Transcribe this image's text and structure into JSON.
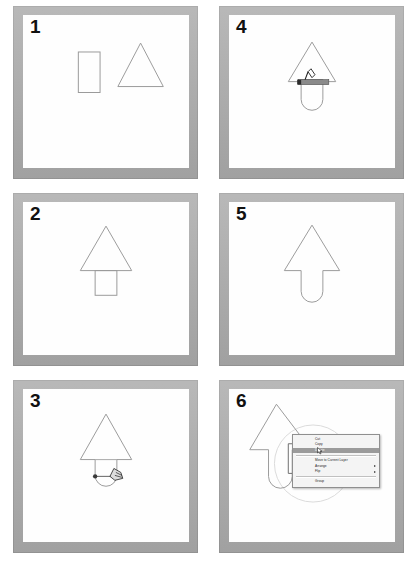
{
  "figure": {
    "panel_count": 6,
    "columns": 2,
    "rows": 3,
    "frame_color": "#a9a9a9",
    "canvas_color": "#fefefe",
    "shape_stroke_color": "#9a9a9a",
    "number_color": "#111111"
  },
  "panels": [
    {
      "number": "1",
      "caption": "Rectangle and triangle drawn separately",
      "shapes": [
        "rectangle",
        "triangle"
      ]
    },
    {
      "number": "2",
      "caption": "Rectangle positioned below triangle",
      "shapes": [
        "rectangle",
        "triangle"
      ]
    },
    {
      "number": "3",
      "caption": "Dragging corner handle to round rectangle bottom",
      "shapes": [
        "rounded-rectangle",
        "triangle"
      ],
      "cursor": "hand-drag-cursor",
      "handle": "corner-radius-handle"
    },
    {
      "number": "4",
      "caption": "Selecting both shapes with selection bar",
      "shapes": [
        "rounded-rectangle",
        "triangle"
      ],
      "cursor": "pointer-cursor",
      "selection": "selection-bar"
    },
    {
      "number": "5",
      "caption": "Merged arrow shape with rounded tail",
      "shapes": [
        "arrow"
      ]
    },
    {
      "number": "6",
      "caption": "Context menu opened on arrow shape",
      "shapes": [
        "arrow"
      ],
      "selection": "selection-circle",
      "cursor": "pointer-cursor"
    }
  ],
  "context_menu": {
    "items": [
      {
        "label": "Cut",
        "highlighted": false,
        "submenu": false
      },
      {
        "label": "Copy",
        "highlighted": false,
        "submenu": false
      },
      {
        "label": "Delete",
        "highlighted": true,
        "submenu": false
      },
      {
        "label": "Move to Current Layer",
        "highlighted": false,
        "submenu": false
      },
      {
        "label": "Arrange",
        "highlighted": false,
        "submenu": true
      },
      {
        "label": "Flip",
        "highlighted": false,
        "submenu": true
      },
      {
        "label": "Group",
        "highlighted": false,
        "submenu": false
      }
    ],
    "highlight_color": "#9b9b9b",
    "background_color": "#f4f4f4"
  }
}
